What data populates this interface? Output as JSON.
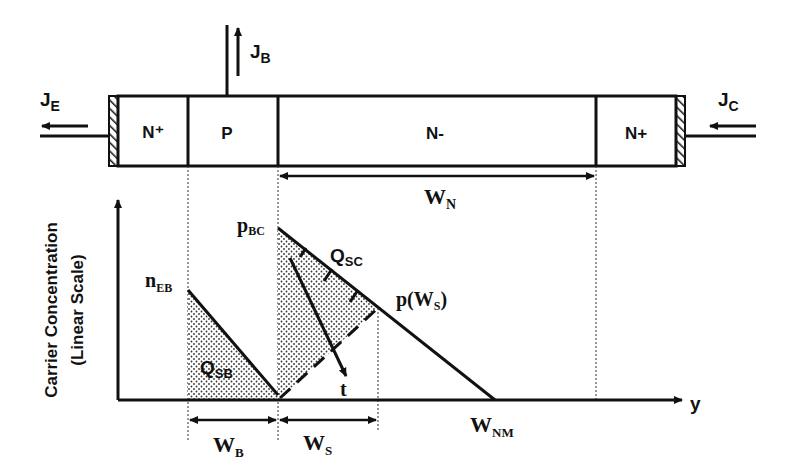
{
  "device": {
    "regions": [
      {
        "name": "emitter",
        "label": "N⁺"
      },
      {
        "name": "base",
        "label": "P"
      },
      {
        "name": "drift",
        "label": "N-"
      },
      {
        "name": "collector",
        "label": "N+"
      }
    ],
    "currents": {
      "emitter": {
        "main": "J",
        "sub": "E"
      },
      "base": {
        "main": "J",
        "sub": "B"
      },
      "collector": {
        "main": "J",
        "sub": "C"
      }
    }
  },
  "graph": {
    "y_axis_label_line1": "Carrier Concentration",
    "y_axis_label_line2": "(Linear Scale)",
    "x_axis_label": "y",
    "labels": {
      "n_EB": {
        "main": "n",
        "sub": "EB"
      },
      "p_BC": {
        "main": "p",
        "sub": "BC"
      },
      "Q_SC": {
        "main": "Q",
        "sub": "SC"
      },
      "Q_SB": {
        "main": "Q",
        "sub": "SB"
      },
      "p_WS": {
        "main": "p(W",
        "sub": "S",
        "tail": ")"
      },
      "t": "t",
      "W_NM": {
        "main": "W",
        "sub": "NM"
      }
    },
    "dimensions": {
      "W_N": {
        "main": "W",
        "sub": "N"
      },
      "W_B": {
        "main": "W",
        "sub": "B"
      },
      "W_S": {
        "main": "W",
        "sub": "S"
      }
    }
  },
  "colors": {
    "stroke": "#111111",
    "background": "#ffffff"
  }
}
